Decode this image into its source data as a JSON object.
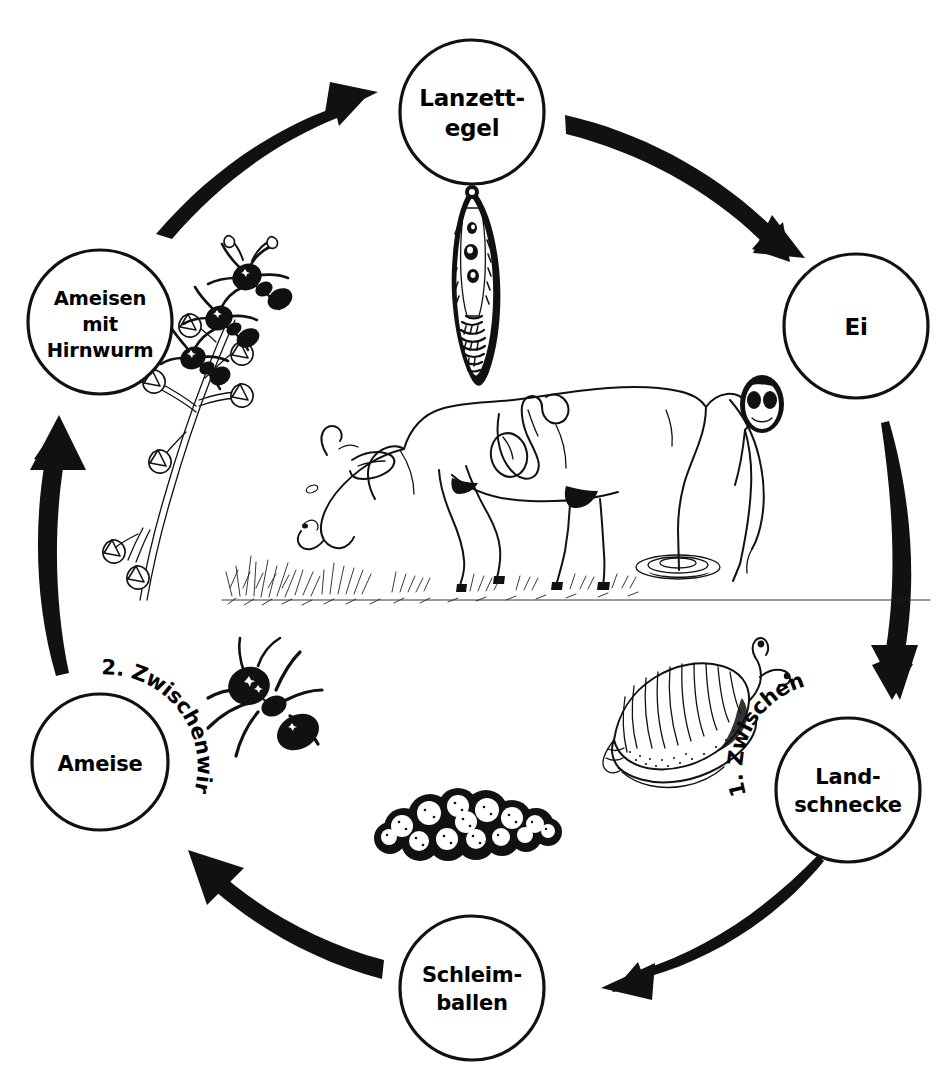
{
  "diagram": {
    "type": "life-cycle-diagram",
    "language": "de",
    "background_color": "#ffffff",
    "ink_color": "#111111",
    "nodes": [
      {
        "id": "lanzettegel",
        "label_lines": [
          "Lanzett-",
          "egel"
        ],
        "position": "top",
        "cx": 472,
        "cy": 112,
        "r": 72
      },
      {
        "id": "ei",
        "label_lines": [
          "Ei"
        ],
        "position": "right-top",
        "cx": 856,
        "cy": 326,
        "r": 72
      },
      {
        "id": "landschnecke",
        "label_lines": [
          "Land-",
          "schnecke"
        ],
        "position": "right-bottom",
        "cx": 848,
        "cy": 790,
        "r": 72
      },
      {
        "id": "schleimballen",
        "label_lines": [
          "Schleim-",
          "ballen"
        ],
        "position": "bottom",
        "cx": 472,
        "cy": 988,
        "r": 72
      },
      {
        "id": "ameise",
        "label_lines": [
          "Ameise"
        ],
        "position": "left-bottom",
        "cx": 100,
        "cy": 762,
        "r": 68
      },
      {
        "id": "ameisen-mit-hirnwurm",
        "label_lines": [
          "Ameisen",
          "mit",
          "Hirnwurm"
        ],
        "position": "left-top",
        "cx": 100,
        "cy": 322,
        "r": 72
      }
    ],
    "curved_labels": [
      {
        "id": "erster-zwischenwirt",
        "text": "1. Zwischenwirt",
        "near_node": "landschnecke"
      },
      {
        "id": "zweiter-zwischenwirt",
        "text": "2. Zwischenwirt",
        "near_node": "ameise"
      }
    ],
    "arrows": [
      {
        "id": "arrow-lanzettegel-to-ei",
        "from": "lanzettegel",
        "to": "ei",
        "direction": "clockwise"
      },
      {
        "id": "arrow-ei-to-landschnecke",
        "from": "ei",
        "to": "landschnecke",
        "direction": "clockwise"
      },
      {
        "id": "arrow-landschnecke-to-schleimballen",
        "from": "landschnecke",
        "to": "schleimballen",
        "direction": "clockwise"
      },
      {
        "id": "arrow-schleimballen-to-ameise",
        "from": "schleimballen",
        "to": "ameise",
        "direction": "clockwise"
      },
      {
        "id": "arrow-ameise-to-ameisen-mit-hirnwurm",
        "from": "ameise",
        "to": "ameisen-mit-hirnwurm",
        "direction": "clockwise"
      },
      {
        "id": "arrow-ameisen-mit-hirnwurm-to-lanzettegel",
        "from": "ameisen-mit-hirnwurm",
        "to": "lanzettegel",
        "direction": "clockwise"
      }
    ],
    "illustrations": [
      {
        "id": "fluke-illustration",
        "name": "lanzettegel-fluke",
        "description": "Lanzettegel (Dicrocoelium), lanzettfoermiger Saugwurm"
      },
      {
        "id": "egg-illustration",
        "name": "fluke-egg",
        "description": "Ei des Lanzettegels mit Miracidium"
      },
      {
        "id": "snail-illustration",
        "name": "land-snail",
        "description": "Landschnecke mit Gehaeuse und Fuehlern"
      },
      {
        "id": "slimeball-illustration",
        "name": "slime-ball-cluster",
        "description": "Schleimballen-Haufen mit Zerkarien"
      },
      {
        "id": "ant-illustration",
        "name": "ant",
        "description": "Ameise"
      },
      {
        "id": "ants-on-grass-illustration",
        "name": "ants-on-grass-stalk",
        "description": "Ameisen mit Hirnwurm festgebissen an Grashalm"
      },
      {
        "id": "cow-illustration",
        "name": "grazing-cow",
        "description": "Grasende Kuh (Endwirt) mit Leber und Gallengang"
      }
    ]
  }
}
